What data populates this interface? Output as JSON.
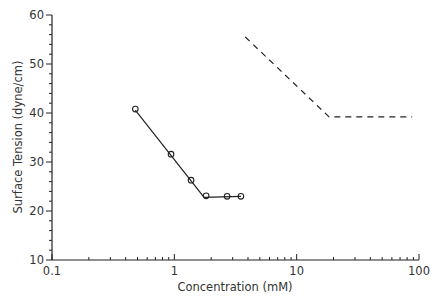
{
  "chart_data": {
    "type": "line",
    "title": "",
    "xlabel": "Concentration (mM)",
    "ylabel": "Surface Tension (dyne/cm)",
    "xscale": "log",
    "xlim": [
      0.1,
      100
    ],
    "ylim": [
      10,
      60
    ],
    "x_ticks": [
      "0.1",
      "1",
      "10",
      "100"
    ],
    "y_ticks": [
      "10",
      "20",
      "30",
      "40",
      "50",
      "60"
    ],
    "grid": false,
    "legend": "none",
    "series": [
      {
        "name": "measured",
        "style": "markers",
        "marker": "open-circle",
        "points": [
          [
            0.48,
            40.8
          ],
          [
            0.94,
            31.6
          ],
          [
            1.37,
            26.3
          ],
          [
            1.82,
            23.1
          ],
          [
            2.7,
            23.0
          ],
          [
            3.5,
            23.0
          ]
        ]
      },
      {
        "name": "fit",
        "style": "solid",
        "points": [
          [
            0.48,
            40.6
          ],
          [
            1.75,
            22.8
          ],
          [
            3.5,
            23.0
          ]
        ]
      },
      {
        "name": "reference",
        "style": "dashed",
        "points": [
          [
            3.8,
            55.5
          ],
          [
            18.4,
            39.2
          ],
          [
            88,
            39.2
          ]
        ]
      }
    ]
  }
}
